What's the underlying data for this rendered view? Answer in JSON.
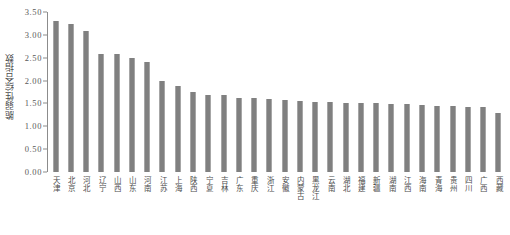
{
  "chart_data": {
    "type": "bar",
    "title": "",
    "xlabel": "",
    "ylabel": "脆弱性综合指数",
    "ylim": [
      0.0,
      3.5
    ],
    "grid": false,
    "legend": "none",
    "orientation": "vertical",
    "bar_color": "#808080",
    "axis_color": "#8c8c8c",
    "sort": "descending",
    "ytick_labels": [
      "3.50",
      "3.00",
      "2.50",
      "2.00",
      "1.50",
      "1.00",
      "0.50",
      "0.00"
    ],
    "ytick_values": [
      3.5,
      3.0,
      2.5,
      2.0,
      1.5,
      1.0,
      0.5,
      0.0
    ],
    "categories": [
      "天津",
      "北京",
      "河北",
      "辽宁",
      "山西",
      "山东",
      "河南",
      "江苏",
      "上海",
      "陕西",
      "宁夏",
      "吉林",
      "广东",
      "重庆",
      "浙江",
      "安徽",
      "内蒙古",
      "黑龙江",
      "云南",
      "湖北",
      "福建",
      "新疆",
      "湖南",
      "江西",
      "海南",
      "青海",
      "贵州",
      "四川",
      "广西",
      "西藏"
    ],
    "values": [
      3.3,
      3.24,
      3.09,
      2.58,
      2.58,
      2.49,
      2.4,
      1.99,
      1.88,
      1.75,
      1.69,
      1.68,
      1.63,
      1.61,
      1.59,
      1.57,
      1.55,
      1.54,
      1.53,
      1.52,
      1.51,
      1.5,
      1.49,
      1.48,
      1.46,
      1.45,
      1.44,
      1.43,
      1.42,
      1.3
    ]
  }
}
